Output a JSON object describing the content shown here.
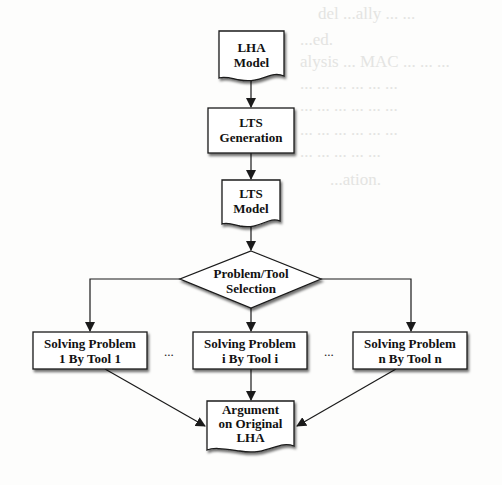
{
  "diagram": {
    "nodes": [
      {
        "id": "lha-model",
        "shape": "document",
        "lines": [
          "LHA",
          "Model"
        ]
      },
      {
        "id": "lts-generation",
        "shape": "process",
        "lines": [
          "LTS",
          "Generation"
        ]
      },
      {
        "id": "lts-model",
        "shape": "document",
        "lines": [
          "LTS",
          "Model"
        ]
      },
      {
        "id": "problem-tool-selection",
        "shape": "decision",
        "lines": [
          "Problem/Tool",
          "Selection"
        ]
      },
      {
        "id": "solve-1",
        "shape": "process",
        "lines": [
          "Solving Problem",
          "1 By Tool 1"
        ]
      },
      {
        "id": "solve-i",
        "shape": "process",
        "lines": [
          "Solving Problem",
          "i By Tool i"
        ]
      },
      {
        "id": "solve-n",
        "shape": "process",
        "lines": [
          "Solving Problem",
          "n By Tool n"
        ]
      },
      {
        "id": "argument",
        "shape": "document",
        "lines": [
          "Argument",
          "on Original",
          "LHA"
        ]
      }
    ],
    "edges": [
      {
        "from": "lha-model",
        "to": "lts-generation"
      },
      {
        "from": "lts-generation",
        "to": "lts-model"
      },
      {
        "from": "lts-model",
        "to": "problem-tool-selection"
      },
      {
        "from": "problem-tool-selection",
        "to": "solve-1"
      },
      {
        "from": "problem-tool-selection",
        "to": "solve-i"
      },
      {
        "from": "problem-tool-selection",
        "to": "solve-n"
      },
      {
        "from": "solve-1",
        "to": "argument"
      },
      {
        "from": "solve-i",
        "to": "argument"
      },
      {
        "from": "solve-n",
        "to": "argument"
      }
    ],
    "ellipsis_left": "...",
    "ellipsis_right": "..."
  }
}
